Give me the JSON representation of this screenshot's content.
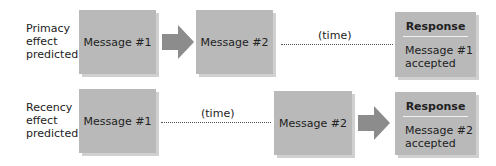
{
  "rows": [
    {
      "id": "primacy",
      "label_lines": [
        "Primacy",
        "effect",
        "predicted:"
      ],
      "first_message": "Message #1",
      "second_message": "Message #2",
      "time_label": "(time)",
      "response": {
        "title": "Response",
        "line1": "Message #1",
        "line2": "accepted"
      }
    },
    {
      "id": "recency",
      "label_lines": [
        "Recency",
        "effect",
        "predicted:"
      ],
      "first_message": "Message #1",
      "second_message": "Message #2",
      "time_label": "(time)",
      "response": {
        "title": "Response",
        "line1": "Message #2",
        "line2": "accepted"
      }
    }
  ],
  "colors": {
    "box": "#b9b9b9",
    "arrow": "#8c8c8c",
    "shadow": "#d0d0d0"
  }
}
